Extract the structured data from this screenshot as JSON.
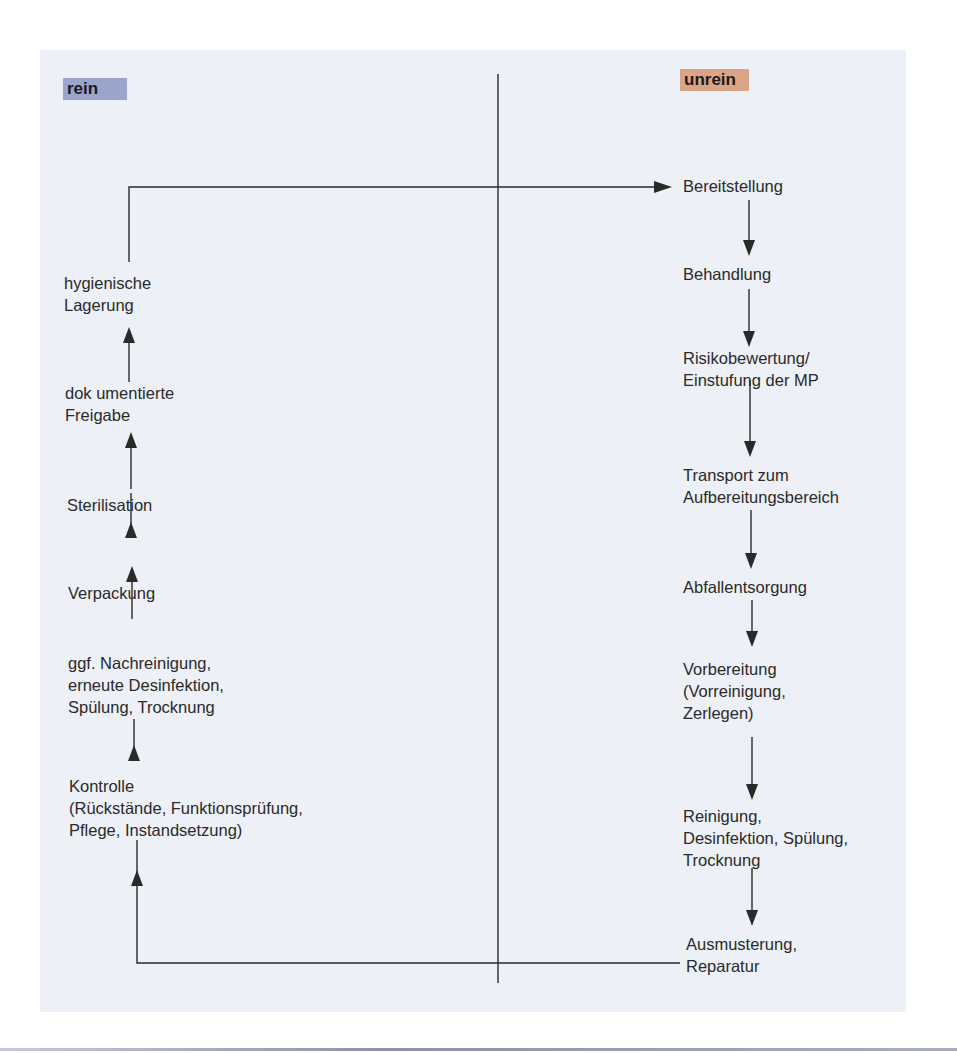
{
  "labels": {
    "clean": "rein",
    "unclean": "unrein"
  },
  "colors": {
    "panel_bg": "#edf0f6",
    "clean_tag": "#9aa4cd",
    "unclean_tag": "#dca487",
    "line": "#2a2a2a"
  },
  "unclean_steps": [
    {
      "text": "Bereitstellung"
    },
    {
      "text": "Behandlung"
    },
    {
      "text": "Risikobewertung/\nEinstufung der MP"
    },
    {
      "text": "Transport zum\nAufbereitungsbereich"
    },
    {
      "text": "Abfallentsorgung"
    },
    {
      "text": "Vorbereitung\n(Vorreinigung,\nZerlegen)"
    },
    {
      "text": "Reinigung,\nDesinfektion, Spülung,\nTrocknung"
    },
    {
      "text": "Ausmusterung,\nReparatur"
    }
  ],
  "clean_steps": [
    {
      "text": "Kontrolle\n(Rückstände, Funktionsprüfung,\nPflege, Instandsetzung)"
    },
    {
      "text": "ggf. Nachreinigung,\nerneute Desinfektion,\nSpülung, Trocknung"
    },
    {
      "text": "Verpackung"
    },
    {
      "text": "Sterilisation"
    },
    {
      "text": "dok umentierte\nFreigabe"
    },
    {
      "text": "hygienische\nLagerung"
    }
  ]
}
